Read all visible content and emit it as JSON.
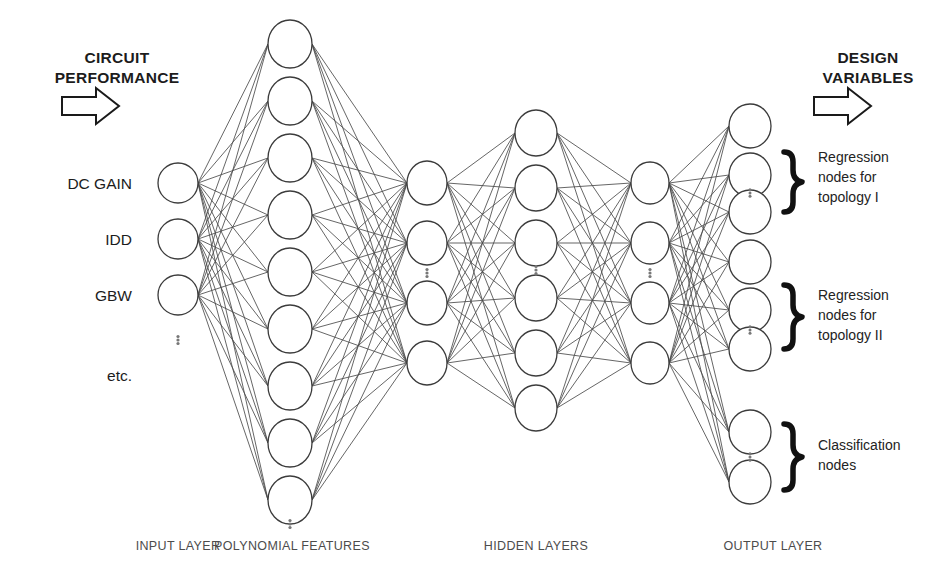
{
  "diagram": {
    "title_hidden": "Neural network architecture for circuit sizing",
    "banners": {
      "input_banner": "CIRCUIT\nPERFORMANCE",
      "input_banner_line1": "CIRCUIT",
      "input_banner_line2": "PERFORMANCE",
      "output_banner_line1": "DESIGN",
      "output_banner_line2": "VARIABLES",
      "input_arrow_icon": "right-block-arrow-icon",
      "output_arrow_icon": "right-block-arrow-icon"
    },
    "input_labels": [
      "DC GAIN",
      "IDD",
      "GBW",
      "etc."
    ],
    "ellipsis_glyph": "⋮",
    "layer_captions": [
      "INPUT LAYER",
      "POLYNOMIAL FEATURES",
      "HIDDEN LAYERS",
      "OUTPUT LAYER"
    ],
    "output_groups": [
      {
        "label_line1": "Regression",
        "label_line2": "nodes for",
        "label_line3": "topology I",
        "brace_icon": "right-curly-brace-icon"
      },
      {
        "label_line1": "Regression",
        "label_line2": "nodes for",
        "label_line3": "topology II",
        "brace_icon": "right-curly-brace-icon"
      },
      {
        "label_line1": "Classification",
        "label_line2": "nodes",
        "label_line3": "",
        "brace_icon": "right-curly-brace-icon"
      }
    ],
    "colors": {
      "background": "#ffffff",
      "node_stroke": "#3b3b3b",
      "edge_stroke": "#4a4a4a",
      "text": "#1c1c1c",
      "caption_text": "#4c4c4c",
      "brace": "#111111"
    }
  },
  "chart_data": {
    "type": "diagram",
    "layers": [
      {
        "name": "INPUT LAYER",
        "x": 178,
        "rx": 20,
        "ry": 20,
        "node_count": 3,
        "node_y": [
          183,
          239,
          295
        ],
        "ellipsis_after": 3,
        "ellipsis_y": 340,
        "labels": [
          "DC GAIN",
          "IDD",
          "GBW"
        ]
      },
      {
        "name": "POLYNOMIAL FEATURES",
        "x": 290,
        "rx": 22,
        "ry": 24,
        "node_count": 9,
        "node_y": [
          44,
          101,
          158,
          215,
          272,
          329,
          386,
          443,
          500
        ],
        "ellipsis_after": 9,
        "ellipsis_y": 524,
        "labels": []
      },
      {
        "name": "HIDDEN LAYER 1",
        "x": 427,
        "rx": 20,
        "ry": 22,
        "node_count": 4,
        "node_y": [
          183,
          243,
          303,
          363
        ],
        "ellipsis_between": [
          2,
          3
        ],
        "ellipsis_y": 273,
        "labels": []
      },
      {
        "name": "HIDDEN LAYER 2",
        "x": 536,
        "rx": 21,
        "ry": 23,
        "node_count": 6,
        "node_y": [
          133,
          188,
          243,
          298,
          353,
          408
        ],
        "ellipsis_between": [
          3,
          4
        ],
        "ellipsis_y": 270,
        "labels": []
      },
      {
        "name": "HIDDEN LAYER 3",
        "x": 650,
        "rx": 19,
        "ry": 21,
        "node_count": 4,
        "node_y": [
          183,
          243,
          303,
          363
        ],
        "ellipsis_between": [
          2,
          3
        ],
        "ellipsis_y": 273,
        "labels": []
      },
      {
        "name": "OUTPUT LAYER",
        "x": 750,
        "rx": 21,
        "ry": 22,
        "node_count": 8,
        "node_y": [
          126,
          175,
          212,
          262,
          310,
          349,
          432,
          482
        ],
        "groups": [
          {
            "nodes": [
              0,
              1,
              2
            ],
            "inner_ellipsis_y": 193
          },
          {
            "nodes": [
              3,
              4,
              5
            ],
            "inner_ellipsis_y": 330
          },
          {
            "nodes": [
              6,
              7
            ],
            "inner_ellipsis_y": 457
          }
        ],
        "labels": []
      }
    ],
    "connections": [
      {
        "from": "INPUT LAYER",
        "to": "POLYNOMIAL FEATURES",
        "style": "fan-full"
      },
      {
        "from": "POLYNOMIAL FEATURES",
        "to": "HIDDEN LAYER 1",
        "style": "fully-connected"
      },
      {
        "from": "HIDDEN LAYER 1",
        "to": "HIDDEN LAYER 2",
        "style": "fully-connected"
      },
      {
        "from": "HIDDEN LAYER 2",
        "to": "HIDDEN LAYER 3",
        "style": "fully-connected"
      },
      {
        "from": "HIDDEN LAYER 3",
        "to": "OUTPUT LAYER",
        "style": "fully-connected"
      }
    ]
  }
}
